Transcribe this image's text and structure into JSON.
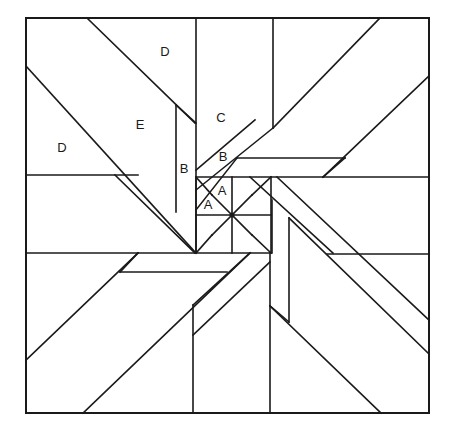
{
  "diagram": {
    "colors": {
      "line": "#1a1a1a",
      "background": "#ffffff"
    },
    "border": {
      "x": 26,
      "y": 18,
      "width": 403,
      "height": 395
    },
    "center": {
      "x": 232,
      "y": 215
    },
    "labels": [
      {
        "id": "label-d-top",
        "text": "D",
        "x": 165,
        "y": 53
      },
      {
        "id": "label-e",
        "text": "E",
        "x": 140,
        "y": 126
      },
      {
        "id": "label-d-left",
        "text": "D",
        "x": 62,
        "y": 149
      },
      {
        "id": "label-c",
        "text": "C",
        "x": 221,
        "y": 119
      },
      {
        "id": "label-b-vertical",
        "text": "B",
        "x": 184,
        "y": 170
      },
      {
        "id": "label-b-diagonal",
        "text": "B",
        "x": 223,
        "y": 158
      },
      {
        "id": "label-a-upper",
        "text": "A",
        "x": 222,
        "y": 192
      },
      {
        "id": "label-a-lower",
        "text": "A",
        "x": 208,
        "y": 206
      }
    ],
    "lines": [
      [
        26,
        175,
        138,
        175
      ],
      [
        87,
        18,
        195,
        123
      ],
      [
        26,
        66,
        195,
        252
      ],
      [
        115,
        175,
        195,
        253
      ],
      [
        176,
        105,
        176,
        212
      ],
      [
        196,
        18,
        196,
        253
      ],
      [
        196,
        123,
        176,
        105
      ],
      [
        196,
        170,
        255,
        120
      ],
      [
        196,
        190,
        273,
        128
      ],
      [
        273,
        18,
        273,
        128
      ],
      [
        237,
        158,
        345,
        158
      ],
      [
        273,
        128,
        380,
        18
      ],
      [
        196,
        210,
        237,
        158
      ],
      [
        429,
        76,
        323,
        177
      ],
      [
        345,
        158,
        323,
        177
      ],
      [
        196,
        177,
        429,
        177
      ],
      [
        196,
        177,
        196,
        253
      ],
      [
        271,
        177,
        271,
        253
      ],
      [
        196,
        215,
        271,
        215
      ],
      [
        232,
        177,
        232,
        253
      ],
      [
        212,
        195,
        252,
        235
      ],
      [
        212,
        235,
        252,
        195
      ],
      [
        196,
        177,
        212,
        195
      ],
      [
        271,
        177,
        252,
        195
      ],
      [
        196,
        253,
        212,
        235
      ],
      [
        271,
        253,
        252,
        235
      ],
      [
        250,
        177,
        333,
        253
      ],
      [
        277,
        177,
        429,
        320
      ],
      [
        272,
        200,
        272,
        253
      ],
      [
        289,
        218,
        289,
        322
      ],
      [
        327,
        254,
        429,
        254
      ],
      [
        270,
        253,
        270,
        413
      ],
      [
        270,
        306,
        381,
        413
      ],
      [
        289,
        322,
        270,
        306
      ],
      [
        429,
        354,
        289,
        218
      ],
      [
        26,
        253,
        270,
        253
      ],
      [
        120,
        272,
        227,
        272
      ],
      [
        26,
        360,
        138,
        253
      ],
      [
        120,
        272,
        138,
        253
      ],
      [
        83,
        413,
        250,
        253
      ],
      [
        193,
        305,
        193,
        413
      ],
      [
        193,
        335,
        270,
        262
      ],
      [
        193,
        305,
        250,
        253
      ]
    ]
  }
}
